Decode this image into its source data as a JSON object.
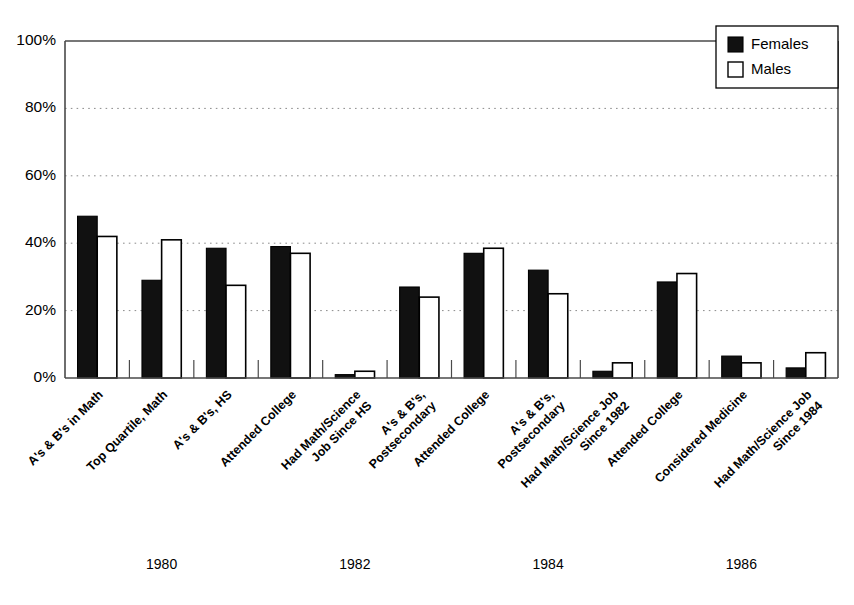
{
  "chart_data": {
    "type": "bar",
    "title": "",
    "subtitle": "",
    "xlabel": "",
    "ylabel": "",
    "ylim": [
      0,
      100
    ],
    "yticks": [
      0,
      20,
      40,
      60,
      80,
      100
    ],
    "ytick_labels": [
      "0%",
      "20%",
      "40%",
      "60%",
      "80%",
      "100%"
    ],
    "grid": "horizontal-dotted",
    "legend_position": "top-right",
    "legend": [
      "Females",
      "Males"
    ],
    "colors": {
      "females": "#111111",
      "males": "#ffffff",
      "outline": "#000000",
      "axis": "#4a4a4a",
      "grid": "#8a8a8a"
    },
    "group_labels": [
      "1980",
      "1982",
      "1984",
      "1986"
    ],
    "categories": [
      "A's & B's in Math",
      "Top Quartile, Math",
      "A's & B's, HS",
      "Attended College",
      "Had Math/Science Job Since HS",
      "A's & B's, Postsecondary",
      "Attended College",
      "A's & B's, Postsecondary",
      "Had Math/Science Job Since 1982",
      "Attended College",
      "Considered Medicine",
      "Had Math/Science Job Since 1984"
    ],
    "category_lines": [
      [
        "A's & B's in Math"
      ],
      [
        "Top Quartile, Math"
      ],
      [
        "A's & B's, HS"
      ],
      [
        "Attended College"
      ],
      [
        "Had Math/Science",
        "Job Since HS"
      ],
      [
        "A's & B's,",
        "Postsecondary"
      ],
      [
        "Attended College"
      ],
      [
        "A's & B's,",
        "Postsecondary"
      ],
      [
        "Had Math/Science Job",
        "Since 1982"
      ],
      [
        "Attended College"
      ],
      [
        "Considered Medicine"
      ],
      [
        "Had Math/Science Job",
        "Since 1984"
      ]
    ],
    "group_spans": [
      [
        0,
        3
      ],
      [
        3,
        6
      ],
      [
        6,
        9
      ],
      [
        9,
        12
      ]
    ],
    "series": [
      {
        "name": "Females",
        "values": [
          48,
          29,
          38.5,
          39,
          1,
          27,
          37,
          32,
          2,
          28.5,
          6.5,
          3
        ]
      },
      {
        "name": "Males",
        "values": [
          42,
          41,
          27.5,
          37,
          2,
          24,
          38.5,
          25,
          4.5,
          31,
          4.5,
          7.5
        ]
      }
    ]
  },
  "legend": {
    "females_label": "Females",
    "males_label": "Males"
  },
  "axis": {
    "y_labels": [
      "100%",
      "80%",
      "60%",
      "40%",
      "20%",
      "0%"
    ]
  },
  "years": [
    "1980",
    "1982",
    "1984",
    "1986"
  ]
}
